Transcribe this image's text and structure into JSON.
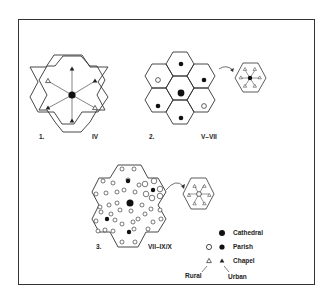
{
  "figure": {
    "panels": [
      {
        "number": "1.",
        "period": "IV",
        "description": "Single diocese: cathedral with radiating chapels"
      },
      {
        "number": "2.",
        "period": "V–VII",
        "description": "Cathedral surrounded by parishes; inset shows parish with rural chapels"
      },
      {
        "number": "3.",
        "period": "VII–IX/X",
        "description": "Dense network of rural parishes; inset shows rural parish with rural chapels"
      }
    ],
    "legend": {
      "items": [
        {
          "label": "Cathedral",
          "symbol": "filled-large-circle"
        },
        {
          "label": "Parish",
          "symbols": [
            "open-circle",
            "filled-circle"
          ]
        },
        {
          "label": "Chapel",
          "symbols": [
            "open-triangle",
            "filled-triangle"
          ]
        }
      ],
      "rural_label": "Rural",
      "urban_label": "Urban"
    },
    "colors": {
      "ink": "#222222",
      "background": "#ffffff"
    }
  }
}
